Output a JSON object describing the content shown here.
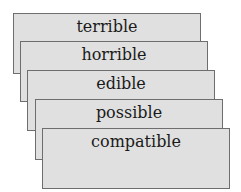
{
  "diagram": {
    "type": "stacked-cards",
    "colors": {
      "card_fill": "#e0e0e0",
      "card_border": "#6e6e6e",
      "text": "#1a1a1a",
      "background": "#ffffff"
    },
    "cards": [
      {
        "label": "terrible",
        "left": 13,
        "top": 13
      },
      {
        "label": "horrible",
        "left": 20,
        "top": 41
      },
      {
        "label": "edible",
        "left": 27,
        "top": 70
      },
      {
        "label": "possible",
        "left": 35,
        "top": 99
      },
      {
        "label": "compatible",
        "left": 42,
        "top": 128
      }
    ]
  }
}
